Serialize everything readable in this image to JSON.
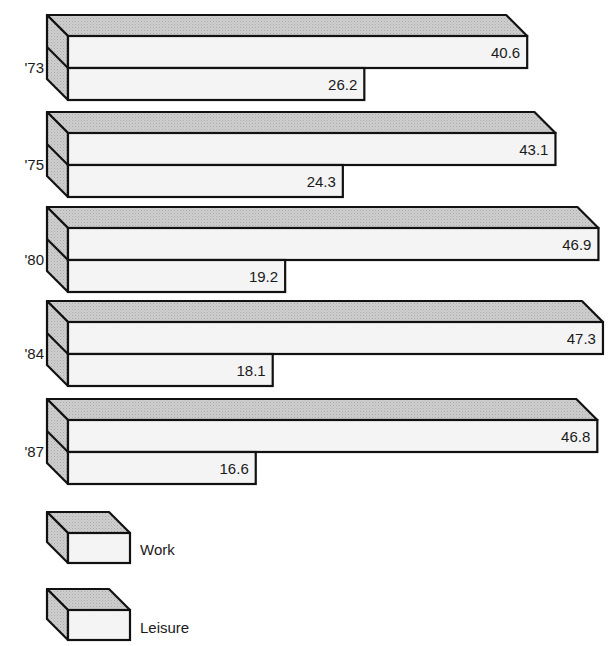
{
  "chart_data": {
    "type": "bar",
    "orientation": "horizontal",
    "style": "3d-stacked-pair",
    "title": "",
    "xlabel": "",
    "ylabel": "",
    "categories": [
      "'73",
      "'75",
      "'80",
      "'84",
      "'87"
    ],
    "series": [
      {
        "name": "Work",
        "values": [
          40.6,
          43.1,
          46.9,
          47.3,
          46.8
        ]
      },
      {
        "name": "Leisure",
        "values": [
          26.2,
          24.3,
          19.2,
          18.1,
          16.6
        ]
      }
    ],
    "data_labels": {
      "Work": [
        "40.6",
        "43.1",
        "46.9",
        "47.3",
        "46.8"
      ],
      "Leisure": [
        "26.2",
        "24.3",
        "19.2",
        "18.1",
        "16.6"
      ]
    },
    "grid": false,
    "axis_visible": false,
    "legend": {
      "position": "bottom-left",
      "entries": [
        "Work",
        "Leisure"
      ]
    },
    "colors": {
      "front": "#f4f4f4",
      "top": "#c9c9c9",
      "side": "#c4c4c4",
      "stroke": "#111111"
    }
  },
  "legend": {
    "work_label": "Work",
    "leisure_label": "Leisure"
  }
}
